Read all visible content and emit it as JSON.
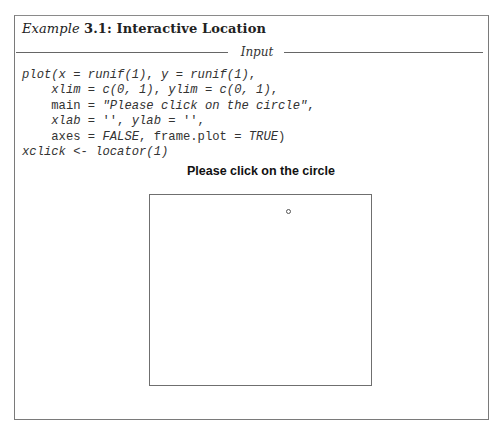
{
  "example": {
    "label": "Example",
    "number_and_title": "3.1: Interactive Location"
  },
  "section_divider": {
    "label": "Input"
  },
  "code": {
    "lines": [
      {
        "indent": "",
        "segments": [
          {
            "text": "plot(x",
            "italic": true
          },
          {
            "text": " = ",
            "italic": false
          },
          {
            "text": "runif(1)",
            "italic": true
          },
          {
            "text": ", ",
            "italic": false
          },
          {
            "text": "y",
            "italic": true
          },
          {
            "text": " = ",
            "italic": false
          },
          {
            "text": "runif(1)",
            "italic": true
          },
          {
            "text": ",",
            "italic": false
          }
        ]
      },
      {
        "indent": "    ",
        "segments": [
          {
            "text": "xlim",
            "italic": true
          },
          {
            "text": " = ",
            "italic": false
          },
          {
            "text": "c(0, 1)",
            "italic": true
          },
          {
            "text": ", ",
            "italic": false
          },
          {
            "text": "ylim",
            "italic": true
          },
          {
            "text": " = ",
            "italic": false
          },
          {
            "text": "c(0, 1)",
            "italic": true
          },
          {
            "text": ",",
            "italic": false
          }
        ]
      },
      {
        "indent": "    ",
        "segments": [
          {
            "text": "main",
            "italic": false
          },
          {
            "text": " = ",
            "italic": false
          },
          {
            "text": "\"Please click on the circle\"",
            "italic": true
          },
          {
            "text": ",",
            "italic": false
          }
        ]
      },
      {
        "indent": "    ",
        "segments": [
          {
            "text": "xlab",
            "italic": true
          },
          {
            "text": " = '', ",
            "italic": false
          },
          {
            "text": "ylab",
            "italic": true
          },
          {
            "text": " = '',",
            "italic": false
          }
        ]
      },
      {
        "indent": "    ",
        "segments": [
          {
            "text": "axes",
            "italic": false
          },
          {
            "text": " = ",
            "italic": false
          },
          {
            "text": "FALSE",
            "italic": true
          },
          {
            "text": ", frame.plot = ",
            "italic": false
          },
          {
            "text": "TRUE",
            "italic": true
          },
          {
            "text": ")",
            "italic": false
          }
        ]
      },
      {
        "indent": "",
        "segments": [
          {
            "text": "xclick",
            "italic": true
          },
          {
            "text": " <- ",
            "italic": false
          },
          {
            "text": "locator(1)",
            "italic": true
          }
        ]
      }
    ]
  },
  "plot": {
    "title": "Please click on the circle",
    "xlim": [
      0,
      1
    ],
    "ylim": [
      0,
      1
    ],
    "axes": false,
    "frame": true,
    "point": {
      "x": 0.63,
      "y": 0.95,
      "shape": "open-circle"
    }
  }
}
